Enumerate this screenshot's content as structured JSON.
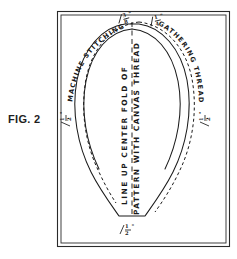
{
  "figure": {
    "caption": "FIG. 2",
    "ink_color": "#1b1b1b",
    "background_color": "#ffffff"
  },
  "frame": {
    "name": "double-ruled-border",
    "style": "double rectangular rule"
  },
  "annotations": {
    "machine_stitching": {
      "text": "MACHINE STITCHING",
      "dimension": "3/8\"",
      "dimension_numerator": "3",
      "dimension_denominator": "8",
      "dimension_unit": "\"",
      "position": "upper-left curved along seam allowance"
    },
    "gathering_thread": {
      "text": "GATHERING THREAD",
      "dimension": "1/4\"",
      "dimension_numerator": "1",
      "dimension_denominator": "4",
      "dimension_unit": "\"",
      "position": "upper-right curved along outer edge"
    },
    "center_fold": {
      "line_1": "LINE UP CENTER FOLD OF",
      "line_2": "PATTERN WITH CANVAS THREAD",
      "position": "vertical centre of pattern"
    }
  },
  "dimensions": [
    {
      "id": "left-seam-allowance",
      "label": "1/2\"",
      "numerator": "1",
      "denominator": "2",
      "unit": "\"",
      "position": "left side"
    },
    {
      "id": "right-seam-allowance",
      "label": "1/2\"",
      "numerator": "1",
      "denominator": "2",
      "unit": "\"",
      "position": "right side"
    },
    {
      "id": "bottom-seam-allowance",
      "label": "1/2\"",
      "numerator": "1",
      "denominator": "2",
      "unit": "\"",
      "position": "bottom centre"
    }
  ],
  "shape": {
    "name": "teardrop-pattern-outline",
    "description": "Rounded dome narrowing to a flat trapezoidal base"
  }
}
